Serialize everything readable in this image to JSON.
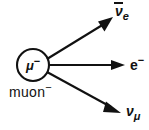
{
  "diagram": {
    "type": "particle-decay-diagram",
    "background_color": "#ffffff",
    "stroke_color": "#111111",
    "source": {
      "core_symbol": "μ",
      "core_charge": "−",
      "caption_text": "muon",
      "caption_charge": "−",
      "shape": "circle",
      "center_x": 33,
      "center_y": 65,
      "radius": 16
    },
    "products": [
      {
        "id": "anti-electron-neutrino",
        "symbol": "ν",
        "has_overbar": true,
        "subscript": "e",
        "charge": "",
        "direction": "up-right",
        "label_x": 115,
        "label_y": 4
      },
      {
        "id": "electron",
        "symbol": "e",
        "has_overbar": false,
        "subscript": "",
        "charge": "−",
        "direction": "right",
        "label_x": 130,
        "label_y": 55
      },
      {
        "id": "muon-neutrino",
        "symbol": "ν",
        "has_overbar": false,
        "subscript": "μ",
        "charge": "",
        "direction": "down-right",
        "label_x": 126,
        "label_y": 104
      }
    ],
    "arrows": [
      {
        "id": "arrow-anti-electron-neutrino",
        "x1": 47,
        "y1": 59,
        "x2": 112,
        "y2": 19
      },
      {
        "id": "arrow-electron",
        "x1": 49,
        "y1": 65,
        "x2": 124,
        "y2": 65
      },
      {
        "id": "arrow-muon-neutrino",
        "x1": 47,
        "y1": 72,
        "x2": 120,
        "y2": 112
      }
    ]
  }
}
